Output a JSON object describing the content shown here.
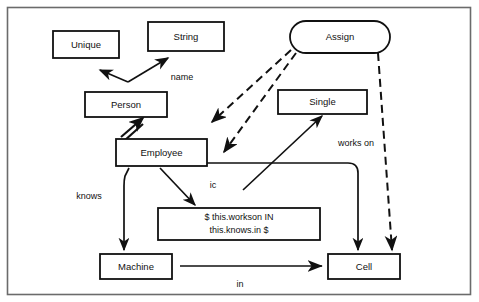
{
  "diagram": {
    "frame": {
      "label": "diagram-frame"
    },
    "nodes": [
      {
        "id": "unique",
        "label": "Unique",
        "shape": "rectangle",
        "x": 53,
        "y": 31,
        "w": 66,
        "h": 27
      },
      {
        "id": "string",
        "label": "String",
        "shape": "rectangle",
        "x": 148,
        "y": 22,
        "w": 76,
        "h": 29
      },
      {
        "id": "assign",
        "label": "Assign",
        "shape": "stadium",
        "x": 290,
        "y": 21,
        "w": 100,
        "h": 32
      },
      {
        "id": "person",
        "label": "Person",
        "shape": "rectangle",
        "x": 85,
        "y": 92,
        "w": 82,
        "h": 25
      },
      {
        "id": "single",
        "label": "Single",
        "shape": "rectangle",
        "x": 278,
        "y": 90,
        "w": 89,
        "h": 24
      },
      {
        "id": "employee",
        "label": "Employee",
        "shape": "rectangle",
        "x": 116,
        "y": 139,
        "w": 91,
        "h": 27
      },
      {
        "id": "constraint",
        "label": "$ this.workson IN this.knows.in $",
        "shape": "rectangle",
        "x": 158,
        "y": 208,
        "w": 162,
        "h": 32
      },
      {
        "id": "machine",
        "label": "Machine",
        "shape": "rectangle",
        "x": 100,
        "y": 254,
        "w": 72,
        "h": 25
      },
      {
        "id": "cell",
        "label": "Cell",
        "shape": "rectangle",
        "x": 328,
        "y": 254,
        "w": 72,
        "h": 25
      }
    ],
    "constraint_lines": [
      "$ this.workson IN",
      "this.knows.in $"
    ],
    "edges": [
      {
        "id": "person-unique",
        "from": "person",
        "to": "unique",
        "style": "solid",
        "arrow": "open",
        "label": ""
      },
      {
        "id": "person-string",
        "from": "person",
        "to": "string",
        "style": "solid",
        "arrow": "open",
        "label": "name"
      },
      {
        "id": "employee-person",
        "from": "employee",
        "to": "person",
        "style": "thick-double",
        "arrow": "open",
        "label": ""
      },
      {
        "id": "assign-employee-left",
        "from": "assign",
        "to": "employee",
        "style": "dashed",
        "arrow": "solid",
        "label": ""
      },
      {
        "id": "assign-employee-right",
        "from": "assign",
        "to": "employee",
        "style": "dashed",
        "arrow": "solid",
        "label": ""
      },
      {
        "id": "assign-cell",
        "from": "assign",
        "to": "cell",
        "style": "dashed",
        "arrow": "solid",
        "label": ""
      },
      {
        "id": "employee-single",
        "from": "employee",
        "to": "single",
        "style": "solid",
        "arrow": "solid",
        "label": "works on"
      },
      {
        "id": "employee-constraint",
        "from": "employee",
        "to": "constraint",
        "style": "solid",
        "arrow": "solid",
        "label": "ic"
      },
      {
        "id": "employee-machine",
        "from": "employee",
        "to": "machine",
        "style": "solid",
        "arrow": "solid",
        "label": "knows"
      },
      {
        "id": "employee-cell",
        "from": "employee",
        "to": "cell",
        "style": "solid",
        "arrow": "solid",
        "label": ""
      },
      {
        "id": "machine-cell",
        "from": "machine",
        "to": "cell",
        "style": "solid",
        "arrow": "solid",
        "label": "in"
      }
    ],
    "edge_labels": {
      "name": "name",
      "works_on": "works on",
      "ic": "ic",
      "knows": "knows",
      "in": "in"
    },
    "colors": {
      "stroke": "#111111",
      "fill": "#ffffff",
      "frame": "#6b6b6b",
      "background": "#ffffff"
    }
  }
}
